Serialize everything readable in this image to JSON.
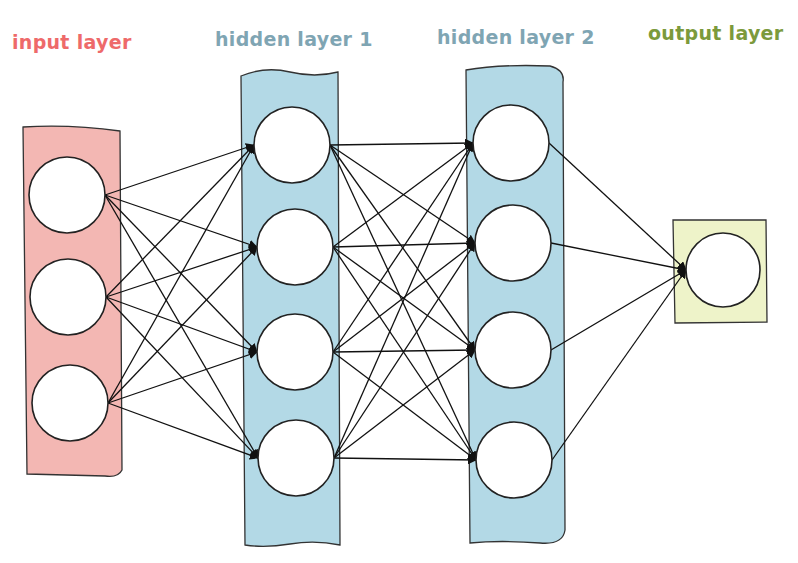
{
  "diagram": {
    "type": "feedforward neural network",
    "layers": [
      {
        "id": "input",
        "label": "input layer",
        "color": "#ee6a6a",
        "fill": "#f3b7b3",
        "nodes": 3
      },
      {
        "id": "hidden1",
        "label": "hidden layer 1",
        "color": "#7fa5b3",
        "fill": "#b3d9e6",
        "nodes": 4
      },
      {
        "id": "hidden2",
        "label": "hidden layer 2",
        "color": "#7fa5b3",
        "fill": "#b3d9e6",
        "nodes": 4
      },
      {
        "id": "output",
        "label": "output layer",
        "color": "#7c9a3c",
        "fill": "#eef3c9",
        "nodes": 1
      }
    ],
    "connections": "fully connected between consecutive layers, arrows point to next layer"
  }
}
